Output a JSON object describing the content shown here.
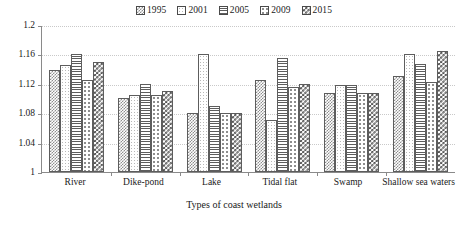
{
  "chart_data": {
    "type": "bar",
    "title": "",
    "xlabel": "Types of coast wetlands",
    "ylabel": "",
    "ylim": [
      1,
      1.2
    ],
    "yticks": [
      "1",
      "1.04",
      "1.08",
      "1.12",
      "1.16",
      "1.2"
    ],
    "ytick_values": [
      1,
      1.04,
      1.08,
      1.12,
      1.16,
      1.2
    ],
    "grid": true,
    "legend_position": "top-center",
    "categories": [
      "River",
      "Dike-pond",
      "Lake",
      "Tidal flat",
      "Swamp",
      "Shallow sea waters"
    ],
    "series": [
      {
        "name": "1995",
        "pattern": "fine-checker",
        "values": [
          1.139,
          1.101,
          1.08,
          1.125,
          1.108,
          1.13
        ]
      },
      {
        "name": "2001",
        "pattern": "light-dots",
        "values": [
          1.145,
          1.105,
          1.16,
          1.071,
          1.118,
          1.16
        ]
      },
      {
        "name": "2005",
        "pattern": "horizontal-lines",
        "values": [
          1.16,
          1.12,
          1.09,
          1.155,
          1.118,
          1.147
        ]
      },
      {
        "name": "2009",
        "pattern": "sparse-dots",
        "values": [
          1.125,
          1.105,
          1.08,
          1.115,
          1.108,
          1.123
        ]
      },
      {
        "name": "2015",
        "pattern": "bold-checker",
        "values": [
          1.15,
          1.11,
          1.08,
          1.12,
          1.108,
          1.165
        ]
      }
    ]
  },
  "legend": {
    "items": [
      {
        "label": "1995"
      },
      {
        "label": "2001"
      },
      {
        "label": "2005"
      },
      {
        "label": "2009"
      },
      {
        "label": "2015"
      }
    ]
  },
  "colors": {
    "axis": "#8a8a8a",
    "grid": "#c9c9c9",
    "bar_outline": "#5d5d5d",
    "text": "#1a1a1a",
    "background": "#ffffff"
  }
}
